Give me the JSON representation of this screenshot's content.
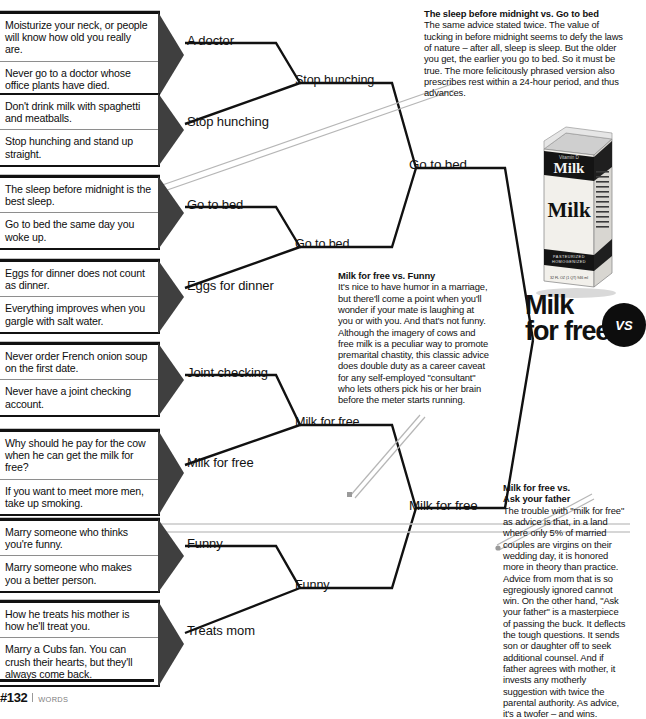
{
  "page": {
    "footer_number": "#132",
    "footer_category": "WORDS"
  },
  "round1": [
    {
      "id": "a-doctor",
      "winner": "A doctor",
      "entries": [
        "Moisturize your neck, or people will know how old you really are.",
        "Never go to a doctor whose office plants have died."
      ]
    },
    {
      "id": "stop-hunching",
      "winner": "Stop hunching",
      "entries": [
        "Don't drink milk with spaghetti and meatballs.",
        "Stop hunching and stand up straight."
      ]
    },
    {
      "id": "go-to-bed",
      "winner": "Go to bed",
      "entries": [
        "The sleep before midnight is the best sleep.",
        "Go to bed the same day you woke up."
      ]
    },
    {
      "id": "eggs-for-dinner",
      "winner": "Eggs for dinner",
      "entries": [
        "Eggs for dinner does not count as dinner.",
        "Everything improves when you gargle with salt water."
      ]
    },
    {
      "id": "joint-checking",
      "winner": "Joint checking",
      "entries": [
        "Never order French onion soup on the first date.",
        "Never have a joint checking account."
      ]
    },
    {
      "id": "milk-for-free",
      "winner": "Milk for free",
      "entries": [
        "Why should he pay for the cow when he can get the milk for free?",
        "If you want to meet more men, take up smoking."
      ]
    },
    {
      "id": "funny",
      "winner": "Funny",
      "entries": [
        "Marry someone who thinks you're funny.",
        "Marry someone who makes you a better person."
      ]
    },
    {
      "id": "treats-mom",
      "winner": "Treats mom",
      "entries": [
        "How he treats his mother is how he'll treat you.",
        "Marry a Cubs fan. You can crush their hearts, but they'll always come back."
      ]
    }
  ],
  "round2": [
    {
      "id": "stop-hunching-r2",
      "label": "Stop hunching"
    },
    {
      "id": "go-to-bed-r2",
      "label": "Go to bed"
    },
    {
      "id": "milk-for-free-r2",
      "label": "Milk for free"
    },
    {
      "id": "funny-r2",
      "label": "Funny"
    }
  ],
  "round3": [
    {
      "id": "go-to-bed-r3",
      "label": "Go to bed"
    },
    {
      "id": "milk-for-free-r3",
      "label": "Milk for free"
    }
  ],
  "champion": {
    "title_line1": "Milk",
    "title_line2": "for free",
    "vs_badge": "VS",
    "carton_brand": "Milk",
    "carton_front": "Milk",
    "carton_topline": "Vitamin D",
    "carton_bottom1": "PASTEURIZED",
    "carton_bottom2": "HOMOGENIZED",
    "carton_volume": "32 FL OZ (1 QT) 946 ml"
  },
  "notes": [
    {
      "id": "note-sleep-vs-bed",
      "heading": "The sleep before midnight vs. Go to bed",
      "body": "The same advice stated twice. The value of tucking in before midnight seems to defy the laws of nature – after all, sleep is sleep. But the older you get, the earlier you go to bed. So it must be true. The more felicitously phrased version also prescribes rest within a 24-hour period, and thus advances."
    },
    {
      "id": "note-milk-vs-funny",
      "heading": "Milk for free vs. Funny",
      "body": "It's nice to have humor in a marriage, but there'll come a point when you'll wonder if your mate is laughing at you or with you. And that's not funny. Although the imagery of cows and free milk is a peculiar way to promote premarital chastity, this classic advice does double duty as a career caveat for any self-employed \"consultant\" who lets others pick his or her brain before the meter starts running."
    },
    {
      "id": "note-milk-vs-father",
      "heading_line1": "Milk for free vs.",
      "heading_line2": "Ask your father",
      "body": "The trouble with \"milk for free\" as advice is that, in a land where only 5% of married couples are virgins on their wedding day, it is honored more in theory than practice. Advice from mom that is so egregiously ignored cannot win. On the other hand, \"Ask your father\" is a masterpiece of passing the buck. It deflects the tough questions. It sends son or daughter off to seek additional counsel. And if father agrees with mother, it invests any motherly suggestion with twice the parental authority. As advice, it's a twofer – and wins."
    }
  ]
}
